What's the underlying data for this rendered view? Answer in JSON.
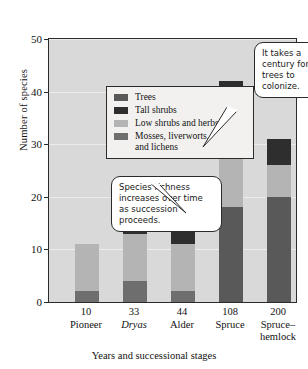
{
  "chart_data": {
    "type": "bar",
    "title": "",
    "xlabel": "Years and successional stages",
    "ylabel": "Number of species",
    "ylim": [
      0,
      50
    ],
    "yticks": [
      0,
      10,
      20,
      30,
      40,
      50
    ],
    "grid": true,
    "stacked": true,
    "legend_position": "inside-upper-left",
    "categories": [
      "Pioneer",
      "Dryas",
      "Alder",
      "Spruce",
      "Spruce–hemlock"
    ],
    "category_years": [
      "10",
      "33",
      "44",
      "108",
      "200"
    ],
    "series": [
      {
        "name": "Mosses, liverworts, and lichens",
        "color": "#6e6e6e",
        "values": [
          2,
          4,
          2,
          0,
          0
        ]
      },
      {
        "name": "Low shrubs and herbs",
        "color": "#b4b4b4",
        "values": [
          9,
          9,
          9,
          14,
          6
        ]
      },
      {
        "name": "Tall shrubs",
        "color": "#2e2e2e",
        "values": [
          0,
          4,
          7,
          10,
          5
        ]
      },
      {
        "name": "Trees",
        "color": "#595959",
        "values": [
          0,
          0,
          0,
          18,
          20
        ]
      }
    ],
    "totals": [
      11,
      17,
      18,
      42,
      31
    ],
    "annotations": [
      {
        "name": "trees-colonize",
        "text": "It takes a century for trees to colonize.",
        "points_to": "Spruce"
      },
      {
        "name": "species-richness",
        "text": "Species richness increases over time as succession proceeds.",
        "points_to": "Alder"
      }
    ]
  },
  "legend": {
    "items": [
      {
        "label": "Trees",
        "color": "#595959"
      },
      {
        "label": "Tall shrubs",
        "color": "#2e2e2e"
      },
      {
        "label": "Low shrubs and herbs",
        "color": "#b4b4b4"
      },
      {
        "label": "Mosses, liverworts,\nand lichens",
        "color": "#6e6e6e"
      }
    ]
  },
  "axes": {
    "y_title": "Number of species",
    "y_ticks": [
      "50",
      "40",
      "30",
      "20",
      "10",
      "0"
    ],
    "x_title": "Years and successional stages",
    "x_items": [
      {
        "years": "10",
        "stage": "Pioneer",
        "italic": false
      },
      {
        "years": "33",
        "stage": "Dryas",
        "italic": true
      },
      {
        "years": "44",
        "stage": "Alder",
        "italic": false
      },
      {
        "years": "108",
        "stage": "Spruce",
        "italic": false
      },
      {
        "years": "200",
        "stage": "Spruce–\nhemlock",
        "italic": false
      }
    ]
  },
  "callouts": {
    "trees": "It takes a century for trees to colonize.",
    "richness": "Species richness increases over time as succession proceeds."
  },
  "colors": {
    "plot_background": "#d9d9d9",
    "gridline": "#ececed",
    "frame": "#2b2b2b",
    "legend_background": "#f2f1ef",
    "callout_background": "#ffffff"
  }
}
